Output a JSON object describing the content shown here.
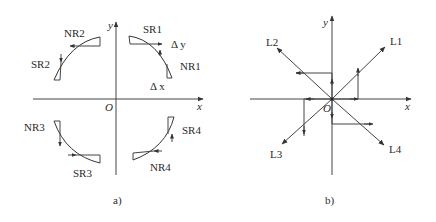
{
  "figure": {
    "panel_a": {
      "caption": "a)",
      "axes": {
        "x_label": "x",
        "y_label": "y",
        "origin_label": "O"
      },
      "labels": {
        "SR1": "SR1",
        "NR1": "NR1",
        "SR2": "SR2",
        "NR2": "NR2",
        "SR3": "SR3",
        "NR3": "NR3",
        "SR4": "SR4",
        "NR4": "NR4",
        "delta_y": "Δ y",
        "delta_x": "Δ x"
      }
    },
    "panel_b": {
      "caption": "b)",
      "axes": {
        "x_label": "x",
        "y_label": "y",
        "origin_label": "O"
      },
      "labels": {
        "L1": "L1",
        "L2": "L2",
        "L3": "L3",
        "L4": "L4"
      }
    }
  },
  "colors": {
    "line": "#444444",
    "text": "#2a2a2a",
    "background": "#ffffff"
  }
}
